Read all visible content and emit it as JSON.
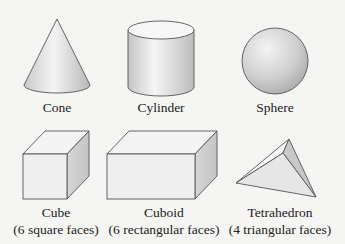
{
  "shapes": [
    {
      "id": "cone",
      "name": "Cone",
      "desc": ""
    },
    {
      "id": "cylinder",
      "name": "Cylinder",
      "desc": ""
    },
    {
      "id": "sphere",
      "name": "Sphere",
      "desc": ""
    },
    {
      "id": "cube",
      "name": "Cube",
      "desc": "(6 square faces)"
    },
    {
      "id": "cuboid",
      "name": "Cuboid",
      "desc": "(6 rectangular faces)"
    },
    {
      "id": "tetrahedron",
      "name": "Tetrahedron",
      "desc": "(4 triangular faces)"
    }
  ],
  "colors": {
    "background": "#f5f5f3",
    "stroke": "#555555",
    "face_light": "#f2f2f2",
    "face_mid": "#d8d8d8",
    "face_dark": "#bdbdbd"
  }
}
